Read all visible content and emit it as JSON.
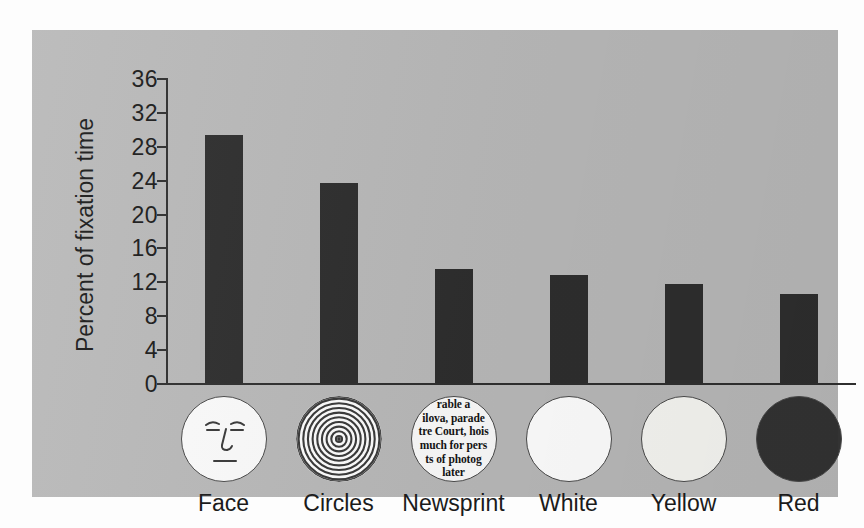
{
  "chart_data": {
    "type": "bar",
    "title": "",
    "xlabel": "",
    "ylabel": "Percent of fixation time",
    "ylim": [
      0,
      36
    ],
    "ytick_step": 4,
    "yticks": [
      "36",
      "32",
      "28",
      "24",
      "20",
      "16",
      "12",
      "8",
      "4",
      "0"
    ],
    "categories": [
      "Face",
      "Circles",
      "Newsprint",
      "White",
      "Yellow",
      "Red"
    ],
    "values": [
      29.3,
      23.6,
      13.4,
      12.8,
      11.7,
      10.5
    ],
    "grid": false,
    "legend": "none",
    "bar_color": "#2e2e2e",
    "panel_color": "#b9b9b9"
  },
  "axis": {
    "y_label": "Percent of fixation time"
  },
  "stimuli": [
    {
      "name": "face",
      "label": "Face",
      "icon": "schematic-face-icon",
      "fill": "#fbfbfb"
    },
    {
      "name": "circles",
      "label": "Circles",
      "icon": "concentric-circles-icon",
      "fill": "#fdfdfd",
      "ring_count": 9
    },
    {
      "name": "newsprint",
      "label": "Newsprint",
      "icon": "newsprint-text-icon",
      "fill": "#fbfbfb",
      "lines": [
        "rable a",
        "ilova, parade",
        "tre Court, hois",
        "much for pers",
        "ts of photog",
        "later"
      ]
    },
    {
      "name": "white",
      "label": "White",
      "icon": "white-disc-icon",
      "fill": "#ffffff"
    },
    {
      "name": "yellow",
      "label": "Yellow",
      "icon": "yellow-disc-icon",
      "fill": "#f7f7f3"
    },
    {
      "name": "red",
      "label": "Red",
      "icon": "red-disc-icon",
      "fill": "#333333"
    }
  ]
}
